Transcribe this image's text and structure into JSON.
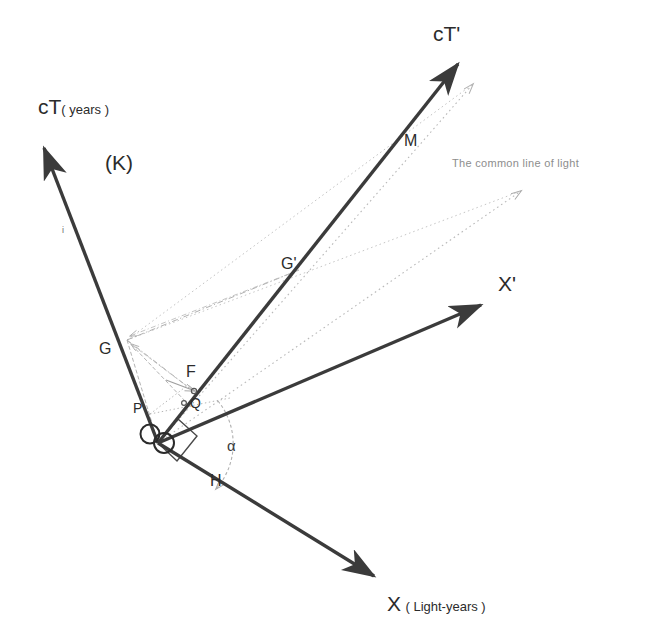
{
  "figure": {
    "title_frame_label": "(K)",
    "background_color": "#ffffff",
    "axis_color": "#3b3b3b",
    "light_ray_color": "#b9b9b9",
    "construction_color": "#a9a9a9",
    "text_color": "#2b2b2b",
    "note_color": "#8d8d8d"
  },
  "axes": [
    {
      "id": "ct",
      "main_label": "cT",
      "sub_label": "( years )",
      "label_x": 38,
      "label_y": 95,
      "from": [
        158,
        443
      ],
      "to": [
        40,
        141
      ],
      "tick_label": "i",
      "tick_label_x": 62,
      "tick_label_y": 226
    },
    {
      "id": "ct-prime",
      "main_label": "cT'",
      "sub_label": "",
      "label_x": 433,
      "label_y": 22,
      "from": [
        158,
        443
      ],
      "to": [
        463,
        58
      ]
    },
    {
      "id": "x",
      "main_label": "X",
      "sub_label": "( Light-years )",
      "label_x": 387,
      "label_y": 592,
      "from": [
        158,
        443
      ],
      "to": [
        379,
        580
      ]
    },
    {
      "id": "x-prime",
      "main_label": "X'",
      "sub_label": "",
      "label_x": 498,
      "label_y": 272,
      "from": [
        158,
        443
      ],
      "to": [
        487,
        301
      ]
    }
  ],
  "points": [
    {
      "id": "G",
      "label": "G",
      "label_x": 99,
      "label_y": 341,
      "x": 127,
      "y": 340,
      "marker": false
    },
    {
      "id": "G-prime",
      "label": "G'",
      "label_x": 281,
      "label_y": 256,
      "x": 299,
      "y": 270,
      "marker": false
    },
    {
      "id": "M",
      "label": "M",
      "label_x": 404,
      "label_y": 133,
      "x": 391,
      "y": 139,
      "marker": false
    },
    {
      "id": "F",
      "label": "F",
      "label_x": 186,
      "label_y": 364,
      "x": 192,
      "y": 390,
      "marker": true
    },
    {
      "id": "Q",
      "label": "Q",
      "label_x": 188,
      "label_y": 398,
      "x": 186,
      "y": 402,
      "marker": true
    },
    {
      "id": "P",
      "label": "P",
      "label_x": 133,
      "label_y": 401,
      "x": 150,
      "y": 414,
      "marker": false
    },
    {
      "id": "H",
      "label": "H",
      "label_x": 210,
      "label_y": 473,
      "x": 206,
      "y": 469,
      "marker": false
    },
    {
      "id": "O1",
      "label": "O",
      "label_x": 139,
      "label_y": 424,
      "x": 149,
      "y": 433,
      "marker": false
    },
    {
      "id": "O2",
      "label": "O",
      "label_x": 152,
      "label_y": 432,
      "x": 162,
      "y": 441,
      "marker": false
    }
  ],
  "annotations": [
    {
      "id": "common-line-of-light",
      "text": "The common line of light",
      "x": 452,
      "y": 158
    },
    {
      "id": "frame-K",
      "text": "(K)",
      "x": 105,
      "y": 152
    },
    {
      "id": "alpha-angle",
      "text": "α",
      "x": 227,
      "y": 438
    }
  ],
  "light_rays": [
    {
      "id": "ray-upper",
      "from": [
        158,
        443
      ],
      "to": [
        473,
        84
      ],
      "arrow": true
    },
    {
      "id": "ray-lower",
      "from": [
        158,
        443
      ],
      "to": [
        521,
        191
      ],
      "arrow": true
    },
    {
      "id": "ray-from-G-upper",
      "from": [
        127,
        340
      ],
      "to": [
        473,
        84
      ],
      "arrow": false
    },
    {
      "id": "ray-from-G-lower",
      "from": [
        127,
        340
      ],
      "to": [
        521,
        191
      ],
      "arrow": false
    }
  ],
  "construction_lines": [
    {
      "id": "G-to-Gprime",
      "from": [
        127,
        340
      ],
      "to": [
        299,
        270
      ]
    },
    {
      "id": "G-to-F",
      "from": [
        127,
        340
      ],
      "to": [
        192,
        390
      ]
    },
    {
      "id": "G-to-Q",
      "from": [
        127,
        340
      ],
      "to": [
        186,
        402
      ]
    },
    {
      "id": "G-to-O",
      "from": [
        127,
        340
      ],
      "to": [
        158,
        443
      ]
    },
    {
      "id": "P-to-Q",
      "from": [
        150,
        414
      ],
      "to": [
        224,
        399
      ]
    },
    {
      "id": "P-to-F",
      "from": [
        150,
        414
      ],
      "to": [
        186,
        386
      ]
    },
    {
      "id": "F-arrow",
      "from": [
        168,
        382
      ],
      "to": [
        196,
        392
      ]
    }
  ],
  "angle_arcs": [
    {
      "id": "alpha-arc",
      "cx": 158,
      "cy": 443,
      "r": 68,
      "start_deg": -32,
      "end_deg": 32
    }
  ],
  "right_angle_marks": [
    {
      "id": "right-angle-origin",
      "x": 158,
      "y": 443,
      "size": 22
    }
  ]
}
